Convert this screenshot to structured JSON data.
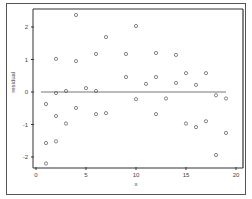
{
  "chart_data": {
    "type": "scatter",
    "title": "",
    "xlabel": "x",
    "ylabel": "residual",
    "xlim": [
      0,
      20
    ],
    "ylim": [
      -2.3,
      2.5
    ],
    "xticks": [
      0,
      5,
      10,
      15,
      20
    ],
    "yticks": [
      -2,
      -1,
      0,
      1,
      2
    ],
    "xtick_labels": [
      "0",
      "5",
      "10",
      "15",
      "20"
    ],
    "ytick_labels": [
      "-2",
      "-1",
      "0",
      "1",
      "2"
    ],
    "grid": false,
    "legend": "none",
    "marker": "open-circle",
    "reference_line": {
      "y": 0,
      "x_from": 0.5,
      "x_to": 19
    },
    "colors": {
      "marker": "#666666",
      "line": "#777777",
      "axis": "#333333"
    },
    "points": [
      {
        "x": 1,
        "y": -0.37
      },
      {
        "x": 1,
        "y": -1.57
      },
      {
        "x": 1,
        "y": -2.2
      },
      {
        "x": 2,
        "y": 1.02
      },
      {
        "x": 2,
        "y": -0.03
      },
      {
        "x": 2,
        "y": -0.74
      },
      {
        "x": 2,
        "y": -1.52
      },
      {
        "x": 3,
        "y": 0.03
      },
      {
        "x": 3,
        "y": -0.97
      },
      {
        "x": 4,
        "y": 2.37
      },
      {
        "x": 4,
        "y": 0.95
      },
      {
        "x": 4,
        "y": -0.49
      },
      {
        "x": 5,
        "y": 0.12
      },
      {
        "x": 6,
        "y": 1.17
      },
      {
        "x": 6,
        "y": 0.03
      },
      {
        "x": 6,
        "y": -0.68
      },
      {
        "x": 7,
        "y": 1.69
      },
      {
        "x": 7,
        "y": -0.65
      },
      {
        "x": 9,
        "y": 1.17
      },
      {
        "x": 9,
        "y": 0.46
      },
      {
        "x": 10,
        "y": 2.03
      },
      {
        "x": 10,
        "y": -0.22
      },
      {
        "x": 11,
        "y": 0.25
      },
      {
        "x": 12,
        "y": 1.2
      },
      {
        "x": 12,
        "y": 0.46
      },
      {
        "x": 12,
        "y": -0.68
      },
      {
        "x": 13,
        "y": -0.2
      },
      {
        "x": 14,
        "y": 1.14
      },
      {
        "x": 14,
        "y": 0.28
      },
      {
        "x": 15,
        "y": 0.58
      },
      {
        "x": 15,
        "y": -0.97
      },
      {
        "x": 16,
        "y": 0.22
      },
      {
        "x": 16,
        "y": -1.08
      },
      {
        "x": 17,
        "y": 0.58
      },
      {
        "x": 17,
        "y": -0.9
      },
      {
        "x": 18,
        "y": -0.1
      },
      {
        "x": 18,
        "y": -1.94
      },
      {
        "x": 19,
        "y": -0.2
      },
      {
        "x": 19,
        "y": -1.26
      }
    ]
  }
}
